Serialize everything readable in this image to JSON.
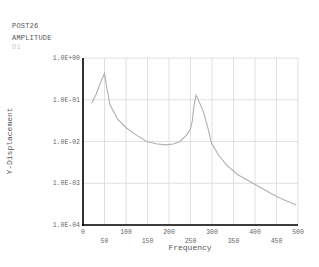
{
  "header": {
    "program": "POST26",
    "title": "AMPLITUDE",
    "variable": "D1"
  },
  "colors": {
    "curve": "#b0b0b0",
    "grid": "#d8d8d8",
    "axis": "#000000",
    "text": "#555555"
  },
  "footer_text": "",
  "chart_data": {
    "type": "line",
    "title": "AMPLITUDE",
    "xlabel": "Frequency",
    "ylabel": "Y-Displacement",
    "yscale": "log",
    "xlim": [
      0,
      500
    ],
    "ylim": [
      0.0001,
      1.0
    ],
    "grid": true,
    "legend": "none",
    "x_ticks": [
      0,
      50,
      100,
      150,
      200,
      250,
      300,
      350,
      400,
      450,
      500
    ],
    "x_tick_labels": [
      "0",
      "50",
      "100",
      "150",
      "200",
      "250",
      "300",
      "350",
      "400",
      "450",
      "500"
    ],
    "y_ticks": [
      1.0,
      0.1,
      0.01,
      0.001,
      0.0001
    ],
    "y_tick_labels": [
      "1.0E+00",
      "1.0E-01",
      "1.0E-02",
      "1.0E-03",
      "1.0E-04"
    ],
    "series": [
      {
        "name": "D1",
        "x": [
          20,
          30,
          40,
          50,
          55,
          63,
          80,
          101,
          125,
          148,
          170,
          191,
          210,
          226,
          240,
          249,
          254,
          258,
          263,
          270,
          280,
          290,
          299,
          315,
          334,
          360,
          388,
          420,
          450,
          475,
          496
        ],
        "values": [
          0.082,
          0.13,
          0.25,
          0.43,
          0.2,
          0.075,
          0.035,
          0.021,
          0.014,
          0.01,
          0.0088,
          0.0083,
          0.0087,
          0.01,
          0.014,
          0.019,
          0.03,
          0.07,
          0.13,
          0.09,
          0.052,
          0.022,
          0.009,
          0.0048,
          0.0027,
          0.0016,
          0.0011,
          0.00072,
          0.00048,
          0.00037,
          0.0003
        ]
      }
    ]
  }
}
